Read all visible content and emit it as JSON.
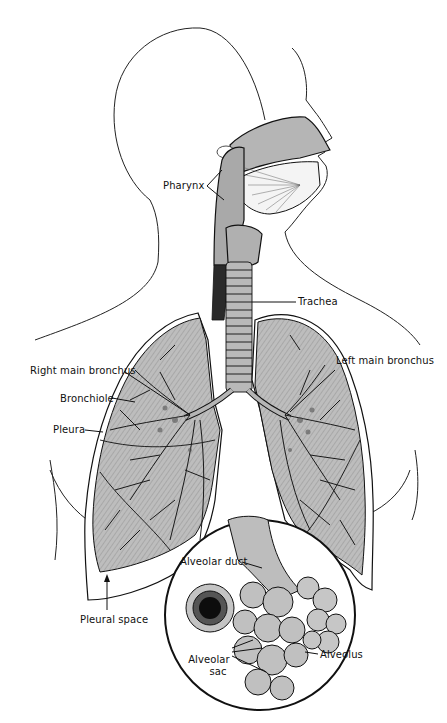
{
  "diagram": {
    "colors": {
      "background": "#ffffff",
      "outline": "#111111",
      "tissue_fill": "#b8b8b8",
      "tissue_light": "#cfcfcf",
      "tissue_dark": "#1a1a1a"
    },
    "labels": {
      "pharynx": "Pharynx",
      "trachea": "Trachea",
      "right_main_bronchus": "Right main bronchus",
      "left_main_bronchus": "Left main bronchus",
      "bronchiole": "Bronchiole",
      "pleura": "Pleura",
      "pleural_space": "Pleural space",
      "alveolar_duct": "Alveolar duct",
      "alveolar_sac_line1": "Alveolar",
      "alveolar_sac_line2": "sac",
      "alveolus": "Alveolus"
    },
    "inset": {
      "description": "Magnified view of alveolar duct and alveolar sacs"
    }
  }
}
